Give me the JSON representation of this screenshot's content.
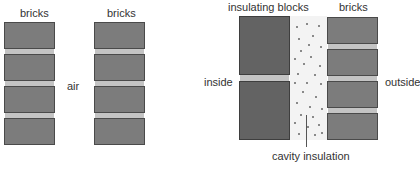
{
  "left_diagram": {
    "labels": {
      "bricks_left": "bricks",
      "bricks_right": "bricks",
      "gap": "air"
    }
  },
  "right_diagram": {
    "labels": {
      "blocks": "insulating blocks",
      "bricks": "bricks",
      "inside": "inside",
      "outside": "outside",
      "cavity": "cavity insulation"
    }
  },
  "colors": {
    "brick": "#7c7c7c",
    "block": "#636363",
    "mortar": "#c4c4c4",
    "cavity": "#f3f3f3"
  }
}
